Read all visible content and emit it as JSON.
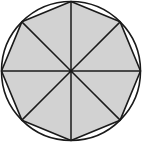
{
  "diagram": {
    "type": "inscribed-regular-octagon",
    "center": [
      71,
      71
    ],
    "circle_radius": 69.5,
    "polygon_sides": 8,
    "polygon_radius": 69.5,
    "rotation_deg": 0,
    "radial_lines": 8,
    "colors": {
      "fill": "#d2d2d2",
      "stroke": "#1a1a1a",
      "background": "#ffffff"
    }
  }
}
